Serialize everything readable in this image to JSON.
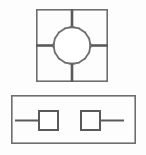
{
  "figure": {
    "background_color": "#fdfdfd",
    "line_color": "#6e6e6e",
    "line_color_dark": "#5a5a5a",
    "fill_color": "#ffffff",
    "width": 146,
    "height": 155,
    "panels": [
      {
        "id": "panel-top",
        "name": "square-frame-with-central-ring",
        "shape": "square",
        "x": 36,
        "y": 9,
        "width": 72,
        "height": 73,
        "stroke_width": 1.6,
        "contents": {
          "ring": {
            "name": "central-ring",
            "shape": "circle-polygon",
            "cx": 72,
            "cy": 45.5,
            "r": 18.5,
            "sides": 16,
            "stroke_width": 1.8,
            "texture": "stippled"
          },
          "spokes": [
            {
              "name": "spoke-north",
              "direction": "north",
              "x1": 72,
              "y1": 9,
              "x2": 72,
              "y2": 27,
              "stroke_width": 2.6
            },
            {
              "name": "spoke-south",
              "direction": "south",
              "x1": 72,
              "y1": 64,
              "x2": 72,
              "y2": 82,
              "stroke_width": 2.6
            },
            {
              "name": "spoke-west",
              "direction": "west",
              "x1": 36,
              "y1": 45.5,
              "x2": 54,
              "y2": 45.5,
              "stroke_width": 2.6
            },
            {
              "name": "spoke-east",
              "direction": "east",
              "x1": 90,
              "y1": 45.5,
              "x2": 108,
              "y2": 45.5,
              "stroke_width": 2.6
            }
          ]
        }
      },
      {
        "id": "panel-bottom",
        "name": "rectangular-frame-with-two-nodes",
        "shape": "rectangle",
        "x": 11,
        "y": 95,
        "width": 125,
        "height": 49,
        "stroke_width": 1.6,
        "contents": {
          "nodes": [
            {
              "name": "node-left",
              "shape": "square",
              "x": 38,
              "y": 110,
              "width": 21,
              "height": 21,
              "stroke_width": 2.0
            },
            {
              "name": "node-right",
              "shape": "square",
              "x": 80,
              "y": 110,
              "width": 21,
              "height": 21,
              "stroke_width": 2.0
            }
          ],
          "leads": [
            {
              "name": "lead-left",
              "side": "left",
              "x1": 15,
              "y1": 120.5,
              "x2": 38,
              "y2": 120.5,
              "stroke_width": 2.0
            },
            {
              "name": "lead-right",
              "side": "right",
              "x1": 101,
              "y1": 120.5,
              "x2": 124,
              "y2": 120.5,
              "stroke_width": 2.0
            }
          ]
        }
      }
    ]
  }
}
